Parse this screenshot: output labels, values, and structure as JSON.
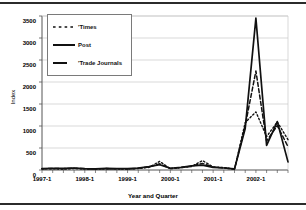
{
  "chart_data": {
    "type": "line",
    "title": "",
    "xlabel": "Year and Quarter",
    "ylabel": "Index",
    "ylim": [
      0,
      3500
    ],
    "ytick_values": [
      0,
      500,
      1000,
      1500,
      2000,
      2500,
      3000,
      3500
    ],
    "ytick_labels": [
      "0",
      "500",
      "1000",
      "1500",
      "2000",
      "2500",
      "3000",
      "3500"
    ],
    "grid": "horizontal",
    "legend_position": "upper-left-inside",
    "x": [
      "1997-1",
      "1997-2",
      "1997-3",
      "1997-4",
      "1998-1",
      "1998-2",
      "1998-3",
      "1998-4",
      "1999-1",
      "1999-2",
      "1999-3",
      "1999-4",
      "2000-1",
      "2000-2",
      "2000-3",
      "2000-4",
      "2001-1",
      "2001-2",
      "2001-3",
      "2001-4",
      "2002-1",
      "2002-2",
      "2002-3",
      "2002-4"
    ],
    "xtick_labels": [
      "1997-1",
      "1998-1",
      "1999-1",
      "2000-1",
      "2001-1",
      "2002-1"
    ],
    "xtick_positions": [
      0,
      4,
      8,
      12,
      16,
      20
    ],
    "series": [
      {
        "name": "Times",
        "style": "dotted",
        "color": "#111111",
        "values": [
          25,
          30,
          20,
          35,
          25,
          20,
          30,
          25,
          20,
          35,
          60,
          195,
          30,
          55,
          80,
          215,
          70,
          55,
          20,
          1080,
          1320,
          760,
          1090,
          690
        ]
      },
      {
        "name": "Post",
        "style": "solid",
        "color": "#111111",
        "values": [
          30,
          40,
          35,
          45,
          30,
          25,
          35,
          30,
          30,
          45,
          75,
          120,
          40,
          60,
          95,
          110,
          60,
          45,
          25,
          945,
          3450,
          560,
          1100,
          185
        ]
      },
      {
        "name": "Trade Journals",
        "style": "dashed",
        "color": "#111111",
        "values": [
          28,
          35,
          30,
          40,
          28,
          22,
          32,
          28,
          25,
          40,
          68,
          140,
          35,
          58,
          88,
          150,
          65,
          50,
          22,
          1010,
          2250,
          660,
          1010,
          530
        ]
      }
    ]
  },
  "legend": {
    "entries": [
      {
        "label": "'Times"
      },
      {
        "label": "Post"
      },
      {
        "label": "'Trade Journals"
      }
    ]
  }
}
